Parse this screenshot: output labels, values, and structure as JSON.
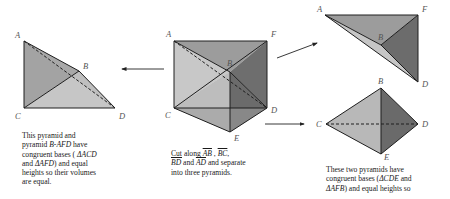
{
  "diagram": {
    "colors": {
      "light_face": "#c4c4c4",
      "mid_face": "#a0a0a0",
      "dark_face": "#6e6e6e",
      "edge": "#1e1e1e",
      "label": "#555555"
    },
    "left_pyramid": {
      "labels": {
        "A": "A",
        "B": "B",
        "C": "C",
        "D": "D"
      },
      "caption": {
        "line1": "This pyramid and",
        "line2_pre": "pyramid ",
        "line2_name": "B-AFD",
        "line2_post": " have",
        "line3_pre": "congruent bases ( ",
        "line3_tri": "ΔACD",
        "line4_pre": "and ",
        "line4_tri": "ΔAFD",
        "line4_post": ") and equal",
        "line5": "heights so their volumes",
        "line6": "are equal."
      }
    },
    "center_prism": {
      "labels": {
        "A": "A",
        "B": "B",
        "C": "C",
        "D": "D",
        "E": "E",
        "F": "F"
      },
      "caption": {
        "cut_word": "Cut",
        "along": " along ",
        "seg1": "AB",
        "sep1": " , ",
        "seg2": "BC",
        "sep2": ",",
        "seg3": "BD",
        "and1": " and ",
        "seg4": "AD",
        "rest1": " and separate",
        "rest2": "into three pyramids."
      }
    },
    "top_right_pyramid": {
      "labels": {
        "A": "A",
        "B": "B",
        "D": "D",
        "F": "F"
      }
    },
    "bottom_right_pyramid": {
      "labels": {
        "B": "B",
        "C": "C",
        "D": "D",
        "E": "E"
      },
      "caption": {
        "line1": "These two pyramids have",
        "line2_pre": "congruent bases (",
        "line2_tri": "ΔCDE",
        "line2_post": " and",
        "line3_tri": "ΔAFB",
        "line3_post": ") and equal heights so"
      }
    },
    "arrows": [
      {
        "name": "to-left-pyramid",
        "from": [
          164,
          69
        ],
        "to": [
          121,
          69
        ]
      },
      {
        "name": "to-top-right-pyramid",
        "from": [
          277,
          58
        ],
        "to": [
          318,
          43
        ]
      },
      {
        "name": "to-bottom-right-pyramid",
        "from": [
          265,
          124
        ],
        "to": [
          305,
          124
        ]
      }
    ]
  }
}
